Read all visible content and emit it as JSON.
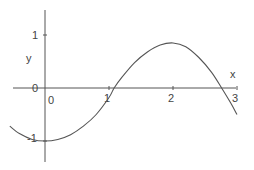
{
  "chart_data": {
    "type": "line",
    "title": "",
    "xlabel": "x",
    "ylabel": "y",
    "xlim": [
      -0.55,
      3.0
    ],
    "ylim": [
      -1.4,
      1.5
    ],
    "grid": false,
    "legend": null,
    "x_ticks": [
      0,
      1,
      2,
      3
    ],
    "x_tick_labels": [
      "0",
      "1",
      "2",
      "3"
    ],
    "y_ticks": [
      -1,
      0,
      1
    ],
    "y_tick_labels": [
      "-1",
      "0",
      "1"
    ],
    "series": [
      {
        "name": "curve",
        "color": "#555555",
        "x": [
          -0.55,
          -0.4,
          -0.2,
          0.0,
          0.2,
          0.4,
          0.6,
          0.8,
          1.0,
          1.08,
          1.2,
          1.4,
          1.6,
          1.8,
          2.0,
          2.2,
          2.4,
          2.6,
          2.76,
          2.9,
          3.0
        ],
        "y": [
          -0.72,
          -0.86,
          -0.97,
          -1.0,
          -0.97,
          -0.88,
          -0.72,
          -0.5,
          -0.18,
          0.0,
          0.2,
          0.48,
          0.68,
          0.81,
          0.85,
          0.78,
          0.58,
          0.3,
          0.0,
          -0.28,
          -0.5
        ]
      }
    ]
  },
  "plot": {
    "origin_px": [
      45,
      88
    ],
    "x_unit_px": 64,
    "y_unit_px": 53,
    "x_axis_px": [
      13,
      236
    ],
    "y_axis_px": [
      10,
      162
    ]
  },
  "labels": {
    "x_axis": "x",
    "y_axis": "y",
    "x_ticks": [
      "0",
      "1",
      "2",
      "3"
    ],
    "y_tick_1": "1",
    "y_tick_0": "0",
    "y_tick_neg1": "-1"
  }
}
